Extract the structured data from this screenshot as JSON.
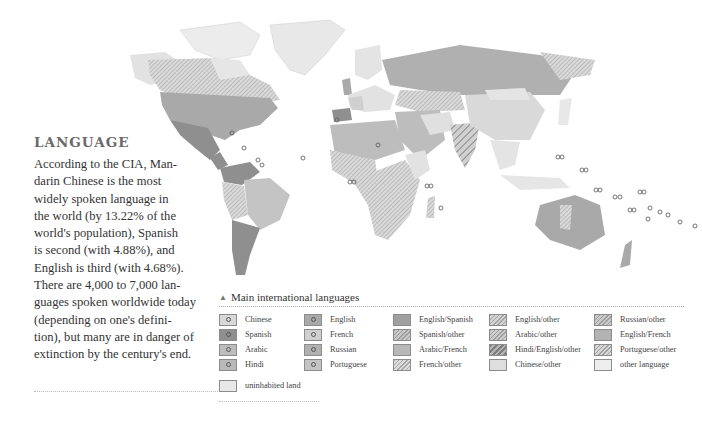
{
  "article": {
    "heading": "LANGUAGE",
    "body": "According to the CIA, Mandarin Chinese is the most widely spoken language in the world (by 13.22% of the world's population), Spanish is second (with 4.88%), and English is third (with 4.68%). There are 4,000 to 7,000 languages spoken worldwide today (depending on one's definition), but many are in danger of extinction by the century's end.",
    "lines": [
      "According to the CIA, Man-",
      "darin Chinese is the most",
      "widely spoken language in",
      "the world (by 13.22% of the",
      "world's population), Spanish",
      "is second (with 4.88%), and",
      "English is third (with 4.68%).",
      "There are 4,000 to 7,000 lan-",
      "guages spoken worldwide today",
      "(depending on one's defini-",
      "tion), but many are in danger of",
      "extinction by the century's end."
    ],
    "stats": {
      "mandarin_chinese_pct": "13.22%",
      "spanish_pct": "4.88%",
      "english_pct": "4.68%",
      "languages_range": "4,000 to 7,000"
    }
  },
  "map": {
    "title": "World map of main international languages",
    "colors": {
      "ocean": "#ffffff",
      "border": "#f4f4f4",
      "english": "#a9a9a9",
      "spanish": "#8f8f8f",
      "russian": "#b0b0b0",
      "chinese": "#d9d9d9",
      "arabic": "#bdbdbd",
      "french": "#cfcfcf",
      "portuguese": "#c4c4c4",
      "hindi": "#b9b9b9",
      "other": "#e6e6e6",
      "uninhabited": "#e8e8e8"
    }
  },
  "legend": {
    "icon": "triangle-icon",
    "title": "Main international languages",
    "items": [
      {
        "label": "Chinese",
        "style": "dot",
        "color": "#d9d9d9"
      },
      {
        "label": "Spanish",
        "style": "dot",
        "color": "#8f8f8f"
      },
      {
        "label": "Arabic",
        "style": "dot",
        "color": "#bdbdbd"
      },
      {
        "label": "Hindi",
        "style": "dot",
        "color": "#b9b9b9"
      },
      {
        "label": "English",
        "style": "dot",
        "color": "#a9a9a9"
      },
      {
        "label": "French",
        "style": "dot",
        "color": "#cfcfcf"
      },
      {
        "label": "Russian",
        "style": "dot",
        "color": "#b0b0b0"
      },
      {
        "label": "Portuguese",
        "style": "dot",
        "color": "#c4c4c4"
      },
      {
        "label": "English/Spanish",
        "style": "solid",
        "color": "#a0a0a0"
      },
      {
        "label": "Spanish/other",
        "style": "hatch",
        "color": "#c8c8c8"
      },
      {
        "label": "Arabic/French",
        "style": "solid",
        "color": "#b8b8b8"
      },
      {
        "label": "French/other",
        "style": "hatch",
        "color": "#dcdcdc"
      },
      {
        "label": "English/other",
        "style": "hatch",
        "color": "#d4d4d4"
      },
      {
        "label": "Arabic/other",
        "style": "hatch",
        "color": "#cdcdcd"
      },
      {
        "label": "Hindi/English/other",
        "style": "hatch",
        "color": "#b5b5b5"
      },
      {
        "label": "Chinese/other",
        "style": "solid",
        "color": "#dedede"
      },
      {
        "label": "Russian/other",
        "style": "hatch",
        "color": "#cacaca"
      },
      {
        "label": "English/French",
        "style": "solid",
        "color": "#b3b3b3"
      },
      {
        "label": "Portuguese/other",
        "style": "hatch",
        "color": "#d6d6d6"
      },
      {
        "label": "other language",
        "style": "solid",
        "color": "#eeeeee"
      },
      {
        "label": "uninhabited land",
        "style": "solid",
        "color": "#e8e8e8"
      }
    ]
  }
}
